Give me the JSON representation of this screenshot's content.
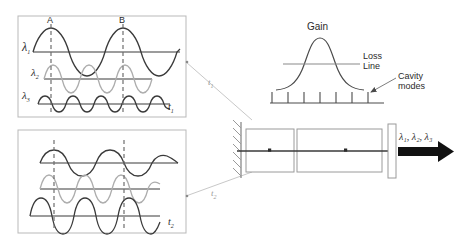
{
  "figure": {
    "colors": {
      "panel_border": "#b9b9b9",
      "wave_dark": "#3a3a3a",
      "wave_light": "#adadad",
      "dashed_marker": "#6e6e6e",
      "cavity_outline": "#9a9a9a",
      "axis": "#555555",
      "arrow_fill": "#111111",
      "connector": "#c8c8c8",
      "text": "#2b2b2b"
    }
  },
  "panel_top": {
    "time_label": "t",
    "time_sub": "1",
    "marker_a": "A",
    "marker_b": "B",
    "waves": [
      {
        "name": "lambda-1",
        "symbol": "λ",
        "sub": "1",
        "tone": "dark",
        "amplitude": 26,
        "periods": 2,
        "phase": 0.25
      },
      {
        "name": "lambda-2",
        "symbol": "λ",
        "sub": "2",
        "tone": "light",
        "amplitude": 14,
        "periods": 3,
        "phase": 0.25
      },
      {
        "name": "lambda-3",
        "symbol": "λ",
        "sub": "3",
        "tone": "dark",
        "amplitude": 7,
        "periods": 4,
        "phase": 0.25
      }
    ]
  },
  "panel_bottom": {
    "time_label": "t",
    "time_sub": "2",
    "waves": [
      {
        "name": "lambda-1",
        "symbol": "λ",
        "sub": "1",
        "tone": "dark",
        "amplitude": 13,
        "periods": 2,
        "phase": 0.25
      },
      {
        "name": "lambda-2",
        "symbol": "λ",
        "sub": "2",
        "tone": "light",
        "amplitude": 16,
        "periods": 3,
        "phase": 0.25
      },
      {
        "name": "lambda-3",
        "symbol": "λ",
        "sub": "3",
        "tone": "dark",
        "amplitude": 22,
        "periods": 4,
        "phase": 0.25
      }
    ]
  },
  "connectors": {
    "upper_label": "t",
    "upper_sub": "1",
    "lower_label": "t",
    "lower_sub": "2"
  },
  "gain_plot": {
    "gain_label": "Gain",
    "loss_label_line1": "Loss",
    "loss_label_line2": "Line",
    "cavity_modes_label_line1": "Cavity",
    "cavity_modes_label_line2": "modes",
    "mode_count": 7,
    "curve_peak_height": 34,
    "loss_line_level": 0.46
  },
  "cavity": {
    "mirror_name": "high-reflector-mirror",
    "output_coupler_name": "output-coupler",
    "output_label": "λ",
    "output_text": "λ₁, λ₂, λ₃",
    "chamber_count": 2
  }
}
